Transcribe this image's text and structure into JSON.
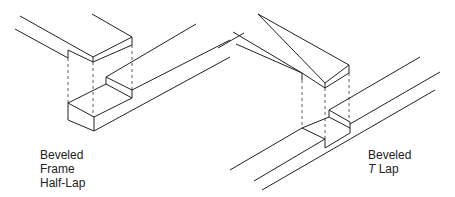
{
  "labels": {
    "left": {
      "line1": "Beveled",
      "line2": "Frame",
      "line3": "Half-Lap"
    },
    "right": {
      "line1": "Beveled",
      "line2_italic": "T",
      "line2_rest": " Lap"
    }
  },
  "colors": {
    "line": "#222222",
    "background": "#ffffff"
  }
}
